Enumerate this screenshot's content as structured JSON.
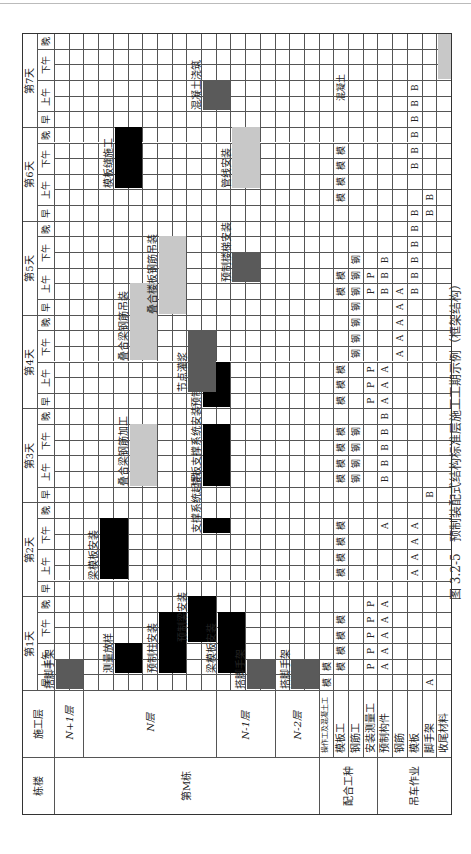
{
  "caption": {
    "figure_no": "图 3.2-5",
    "title": "预制装配式结构标准层施工工期示例（框架结构）"
  },
  "header": {
    "col_building": "栋楼",
    "col_floor": "施工层",
    "days": [
      "第1天",
      "第2天",
      "第3天",
      "第4天",
      "第5天",
      "第6天",
      "第7天"
    ],
    "slots": [
      "早",
      "上午",
      "下午",
      "晚"
    ],
    "slot_spans": [
      1,
      2,
      2,
      1
    ]
  },
  "groups": [
    {
      "label": "第M栋",
      "rows": [
        0,
        18
      ]
    },
    {
      "label": "配合工种",
      "rows": [
        18,
        22
      ]
    },
    {
      "label": "吊车作业",
      "rows": [
        22,
        27
      ]
    }
  ],
  "floors": [
    {
      "label": "N+1层",
      "rows": [
        0,
        2
      ]
    },
    {
      "label": "N层",
      "rows": [
        2,
        11
      ]
    },
    {
      "label": "N-1层",
      "rows": [
        11,
        15
      ]
    },
    {
      "label": "N-2层",
      "rows": [
        15,
        18
      ]
    }
  ],
  "resource_rows": [
    {
      "row": 18,
      "label": "操作工及混凝土工"
    },
    {
      "row": 19,
      "label": "模板工"
    },
    {
      "row": 20,
      "label": "钢筋工"
    },
    {
      "row": 21,
      "label": "安装测量工"
    },
    {
      "row": 22,
      "label": "预制构件"
    },
    {
      "row": 23,
      "label": "钢筋"
    },
    {
      "row": 24,
      "label": "模板"
    },
    {
      "row": 25,
      "label": "脚手架"
    },
    {
      "row": 26,
      "label": "收尾材料"
    }
  ],
  "colors": {
    "black": "#000000",
    "dark": "#5a5a5a",
    "light": "#c8c8c8",
    "grid": "#555555"
  },
  "tasks": [
    {
      "label": "搭脚手架",
      "row": 0,
      "start": 0,
      "len": 2,
      "shade": "dark"
    },
    {
      "label": "测量放样",
      "row": 4,
      "start": 1,
      "len": 2,
      "shade": "black"
    },
    {
      "label": "预制柱安装",
      "row": 7,
      "start": 1,
      "len": 4,
      "shade": "black"
    },
    {
      "label": "预制梁安装",
      "row": 9,
      "start": 3,
      "len": 3,
      "shade": "black"
    },
    {
      "label": "梁模板安装",
      "row": 3,
      "start": 7,
      "len": 4,
      "shade": "black"
    },
    {
      "label": "支撑系统起吊",
      "row": 10,
      "start": 10,
      "len": 1,
      "shade": "black"
    },
    {
      "label": "叠合梁钢筋加工",
      "row": 5,
      "start": 13,
      "len": 4,
      "shade": "light"
    },
    {
      "label": "楼板支撑系统安装",
      "row": 10,
      "start": 13,
      "len": 4,
      "shade": "black"
    },
    {
      "label": "预制楼板安装",
      "row": 10,
      "start": 18,
      "len": 3,
      "shade": "black"
    },
    {
      "label": "节点灌浆",
      "row": 9,
      "start": 19,
      "len": 4,
      "shade": "dark"
    },
    {
      "label": "叠合梁钢筋吊装",
      "row": 5,
      "start": 21,
      "len": 5,
      "shade": "light"
    },
    {
      "label": "叠合楼板钢筋吊装",
      "row": 7,
      "start": 24,
      "len": 5,
      "shade": "light"
    },
    {
      "label": "预制楼梯安装",
      "row": 12,
      "start": 26,
      "len": 2,
      "shade": "dark"
    },
    {
      "label": "模板缝施工",
      "row": 4,
      "start": 32,
      "len": 4,
      "shade": "black"
    },
    {
      "label": "管线安装",
      "row": 12,
      "start": 32,
      "len": 4,
      "shade": "light"
    },
    {
      "label": "混凝土浇筑",
      "row": 10,
      "start": 37,
      "len": 2,
      "shade": "dark"
    },
    {
      "label": "梁模板安装",
      "row": 11,
      "start": 1,
      "len": 4,
      "shade": "black"
    },
    {
      "label": "搭脚手架",
      "row": 13,
      "start": 0,
      "len": 2,
      "shade": "dark"
    },
    {
      "label": "搭脚手架",
      "row": 16,
      "start": 0,
      "len": 2,
      "shade": "dark"
    },
    {
      "label": "",
      "row": 26,
      "start": 39,
      "len": 3,
      "shade": "light"
    }
  ],
  "task_label_offsets": [
    {
      "i": 0,
      "label_row": -1
    },
    {
      "i": 16,
      "label_row": -1
    }
  ],
  "marks": [
    {
      "row": 18,
      "col": 0,
      "t": "模"
    },
    {
      "row": 18,
      "col": 1,
      "t": "模"
    },
    {
      "row": 19,
      "col": 1,
      "t": "模"
    },
    {
      "row": 19,
      "col": 2,
      "t": "模"
    },
    {
      "row": 19,
      "col": 3,
      "t": "模"
    },
    {
      "row": 19,
      "col": 4,
      "t": "模"
    },
    {
      "row": 21,
      "col": 1,
      "t": "P"
    },
    {
      "row": 21,
      "col": 2,
      "t": "P"
    },
    {
      "row": 21,
      "col": 3,
      "t": "P"
    },
    {
      "row": 21,
      "col": 4,
      "t": "P"
    },
    {
      "row": 21,
      "col": 5,
      "t": "P"
    },
    {
      "row": 22,
      "col": 1,
      "t": "A"
    },
    {
      "row": 22,
      "col": 2,
      "t": "A"
    },
    {
      "row": 22,
      "col": 3,
      "t": "A"
    },
    {
      "row": 22,
      "col": 4,
      "t": "A"
    },
    {
      "row": 22,
      "col": 5,
      "t": "A"
    },
    {
      "row": 25,
      "col": 0,
      "t": "A"
    },
    {
      "row": 19,
      "col": 7,
      "t": "模"
    },
    {
      "row": 19,
      "col": 8,
      "t": "模"
    },
    {
      "row": 19,
      "col": 9,
      "t": "模"
    },
    {
      "row": 19,
      "col": 10,
      "t": "模"
    },
    {
      "row": 22,
      "col": 10,
      "t": "A"
    },
    {
      "row": 24,
      "col": 7,
      "t": "A"
    },
    {
      "row": 24,
      "col": 8,
      "t": "A"
    },
    {
      "row": 24,
      "col": 9,
      "t": "A"
    },
    {
      "row": 24,
      "col": 10,
      "t": "A"
    },
    {
      "row": 25,
      "col": 12,
      "t": "B"
    },
    {
      "row": 19,
      "col": 13,
      "t": "模"
    },
    {
      "row": 19,
      "col": 14,
      "t": "模"
    },
    {
      "row": 19,
      "col": 15,
      "t": "模"
    },
    {
      "row": 19,
      "col": 16,
      "t": "模"
    },
    {
      "row": 20,
      "col": 13,
      "t": "钢"
    },
    {
      "row": 20,
      "col": 14,
      "t": "钢"
    },
    {
      "row": 20,
      "col": 15,
      "t": "钢"
    },
    {
      "row": 20,
      "col": 16,
      "t": "钢"
    },
    {
      "row": 22,
      "col": 13,
      "t": "B"
    },
    {
      "row": 22,
      "col": 14,
      "t": "B"
    },
    {
      "row": 22,
      "col": 15,
      "t": "B"
    },
    {
      "row": 22,
      "col": 16,
      "t": "B"
    },
    {
      "row": 22,
      "col": 17,
      "t": "B"
    },
    {
      "row": 19,
      "col": 18,
      "t": "模"
    },
    {
      "row": 19,
      "col": 19,
      "t": "模"
    },
    {
      "row": 19,
      "col": 20,
      "t": "模"
    },
    {
      "row": 21,
      "col": 18,
      "t": "P"
    },
    {
      "row": 21,
      "col": 19,
      "t": "P"
    },
    {
      "row": 21,
      "col": 20,
      "t": "P"
    },
    {
      "row": 22,
      "col": 18,
      "t": "A"
    },
    {
      "row": 22,
      "col": 19,
      "t": "A"
    },
    {
      "row": 22,
      "col": 20,
      "t": "A"
    },
    {
      "row": 20,
      "col": 21,
      "t": "钢"
    },
    {
      "row": 20,
      "col": 22,
      "t": "钢"
    },
    {
      "row": 20,
      "col": 23,
      "t": "钢"
    },
    {
      "row": 20,
      "col": 24,
      "t": "钢"
    },
    {
      "row": 20,
      "col": 25,
      "t": "钢"
    },
    {
      "row": 20,
      "col": 26,
      "t": "钢"
    },
    {
      "row": 20,
      "col": 27,
      "t": "钢"
    },
    {
      "row": 23,
      "col": 21,
      "t": "A"
    },
    {
      "row": 23,
      "col": 22,
      "t": "A"
    },
    {
      "row": 23,
      "col": 23,
      "t": "A"
    },
    {
      "row": 23,
      "col": 24,
      "t": "A"
    },
    {
      "row": 23,
      "col": 25,
      "t": "A"
    },
    {
      "row": 19,
      "col": 25,
      "t": "模"
    },
    {
      "row": 19,
      "col": 26,
      "t": "模"
    },
    {
      "row": 21,
      "col": 25,
      "t": "P"
    },
    {
      "row": 21,
      "col": 26,
      "t": "P"
    },
    {
      "row": 22,
      "col": 25,
      "t": "B"
    },
    {
      "row": 22,
      "col": 26,
      "t": "B"
    },
    {
      "row": 22,
      "col": 27,
      "t": "B"
    },
    {
      "row": 24,
      "col": 25,
      "t": "B"
    },
    {
      "row": 24,
      "col": 26,
      "t": "B"
    },
    {
      "row": 24,
      "col": 27,
      "t": "B"
    },
    {
      "row": 24,
      "col": 28,
      "t": "B"
    },
    {
      "row": 24,
      "col": 29,
      "t": "B"
    },
    {
      "row": 24,
      "col": 30,
      "t": "B"
    },
    {
      "row": 19,
      "col": 31,
      "t": "模"
    },
    {
      "row": 19,
      "col": 32,
      "t": "模"
    },
    {
      "row": 19,
      "col": 33,
      "t": "模"
    },
    {
      "row": 19,
      "col": 34,
      "t": "模"
    },
    {
      "row": 25,
      "col": 30,
      "t": "B"
    },
    {
      "row": 25,
      "col": 31,
      "t": "B"
    },
    {
      "row": 24,
      "col": 33,
      "t": "B"
    },
    {
      "row": 24,
      "col": 34,
      "t": "B"
    },
    {
      "row": 24,
      "col": 35,
      "t": "B"
    },
    {
      "row": 24,
      "col": 36,
      "t": "B"
    },
    {
      "row": 24,
      "col": 37,
      "t": "B"
    },
    {
      "row": 24,
      "col": 38,
      "t": "B"
    },
    {
      "row": 19,
      "col": 37,
      "t": "混凝土"
    }
  ]
}
